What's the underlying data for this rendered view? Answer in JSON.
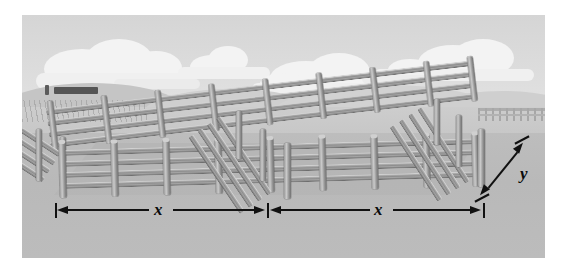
{
  "figure": {
    "scene_items": [
      "sky",
      "clouds",
      "distant-hills",
      "pasture-ground",
      "truck",
      "wooden-rail-fence-corral",
      "center-divider-fence",
      "background-fence-line"
    ],
    "colors": {
      "sky": "#dcdcdc",
      "cloud": "#f3f3f3",
      "hill": "#c5c5c5",
      "ground_far": "#cdcdcd",
      "ground_near": "#bbbbbb",
      "fence_rail": "#9a9a9a",
      "fence_post": "#c0c0c0",
      "annotation": "#111111",
      "truck": "#555555",
      "page_background": "#ffffff"
    }
  },
  "annotations": {
    "width_left": {
      "label": "x",
      "name": "x-dimension-left"
    },
    "width_right": {
      "label": "x",
      "name": "x-dimension-right"
    },
    "depth": {
      "label": "y",
      "name": "y-dimension"
    }
  },
  "clouds": [
    {
      "x": 28,
      "y": 30,
      "w": 88,
      "h": 34
    },
    {
      "x": 82,
      "y": 40,
      "w": 46,
      "h": 24
    },
    {
      "x": 158,
      "y": 35,
      "w": 62,
      "h": 26
    },
    {
      "x": 110,
      "y": 46,
      "w": 110,
      "h": 18
    },
    {
      "x": 255,
      "y": 44,
      "w": 96,
      "h": 32
    },
    {
      "x": 318,
      "y": 52,
      "w": 54,
      "h": 22
    },
    {
      "x": 400,
      "y": 30,
      "w": 80,
      "h": 30
    },
    {
      "x": 348,
      "y": 50,
      "w": 72,
      "h": 20
    }
  ]
}
